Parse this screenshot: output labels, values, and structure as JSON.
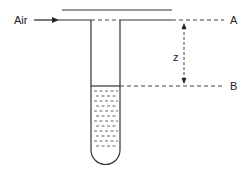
{
  "diagram": {
    "type": "physics-apparatus",
    "labels": {
      "air": "Air",
      "level_a": "A",
      "level_b": "B",
      "distance": "z"
    },
    "colors": {
      "line": "#333333",
      "dash": "#444444",
      "background": "#ffffff"
    }
  }
}
